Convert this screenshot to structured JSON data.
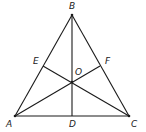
{
  "diagram": {
    "type": "triangle-geometry",
    "points": {
      "A": {
        "label": "A",
        "x": 15,
        "y": 116,
        "lx": 6,
        "ly": 127
      },
      "B": {
        "label": "B",
        "x": 72,
        "y": 15,
        "lx": 69,
        "ly": 9
      },
      "C": {
        "label": "C",
        "x": 129,
        "y": 116,
        "lx": 131,
        "ly": 127
      },
      "D": {
        "label": "D",
        "x": 72,
        "y": 116,
        "lx": 69,
        "ly": 127
      },
      "E": {
        "label": "E",
        "x": 43,
        "y": 66,
        "lx": 33,
        "ly": 64
      },
      "F": {
        "label": "F",
        "x": 100,
        "y": 66,
        "lx": 105,
        "ly": 64
      },
      "O": {
        "label": "O",
        "x": 72,
        "y": 82,
        "lx": 75,
        "ly": 75
      }
    },
    "segments": [
      [
        "A",
        "B"
      ],
      [
        "B",
        "C"
      ],
      [
        "A",
        "C"
      ],
      [
        "B",
        "D"
      ],
      [
        "A",
        "F"
      ],
      [
        "C",
        "E"
      ]
    ],
    "line_color": "#1a1a1a"
  }
}
